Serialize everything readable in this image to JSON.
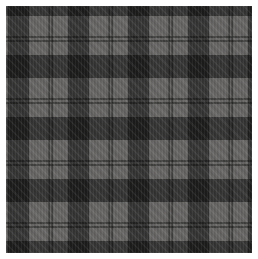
{
  "image": {
    "kind": "fabric-swatch-photo",
    "description": "Gray and black tartan plaid fabric swatch with thin black pinstripes, shown on a white background",
    "pattern": {
      "type": "tartan-plaid",
      "weave": "twill",
      "sett": {
        "vertical_period_px": 60,
        "horizontal_period_px": 62,
        "wide_band_width_px": 21,
        "pinstripe_width_px": 2,
        "pinstripes_per_gap": 2
      }
    },
    "colors": {
      "ground_gray": "#666564",
      "band_black": "#1a1a1a",
      "band_over_gray": "#3a3a3a",
      "frame_white": "#ffffff"
    }
  },
  "css_vars": {
    "--c-gray": "#666564",
    "--c-band": "rgba(0,0,0,0.47)",
    "--c-line": "rgba(0,0,0,0.36)",
    "--c-frame": "#ffffff"
  }
}
